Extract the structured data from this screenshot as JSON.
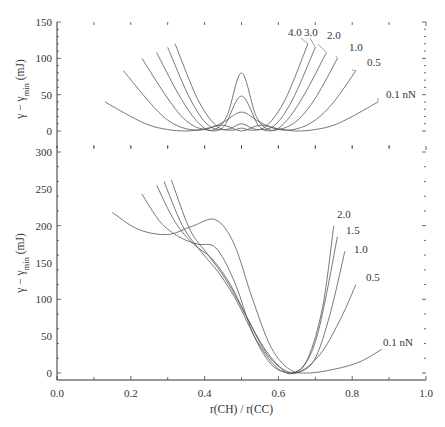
{
  "chart_data": [
    {
      "type": "line",
      "panel": "top",
      "title": "",
      "xlabel": "",
      "ylabel": "γ − γ_min (mJ)",
      "ylabel_parts": {
        "main": "γ − γ",
        "sub": "min",
        "unit": " (mJ)"
      },
      "xlim": [
        0.0,
        1.0
      ],
      "ylim": [
        -23,
        150
      ],
      "yticks": [
        0,
        50,
        100,
        150
      ],
      "ytick_labels": [
        "0",
        "50",
        "100",
        "150"
      ],
      "grid": false,
      "legend": "inline curve labels",
      "labels": [
        "4.0",
        "3.0",
        "2.0",
        "1.0",
        "0.5",
        "0.1 nN"
      ],
      "series": [
        {
          "name": "0.1 nN",
          "x": [
            0.13,
            0.2,
            0.25,
            0.3,
            0.35,
            0.4,
            0.45,
            0.5,
            0.55,
            0.6,
            0.65,
            0.7,
            0.75,
            0.8,
            0.87
          ],
          "values": [
            40,
            20,
            8,
            2,
            0,
            3,
            8,
            0,
            8,
            3,
            0,
            2,
            8,
            20,
            40
          ]
        },
        {
          "name": "0.5",
          "x": [
            0.18,
            0.25,
            0.3,
            0.35,
            0.4,
            0.45,
            0.5,
            0.55,
            0.6,
            0.65,
            0.7,
            0.75,
            0.81
          ],
          "values": [
            83,
            40,
            15,
            3,
            2,
            12,
            26,
            12,
            2,
            3,
            15,
            40,
            83
          ]
        },
        {
          "name": "1.0",
          "x": [
            0.23,
            0.3,
            0.35,
            0.4,
            0.45,
            0.5,
            0.55,
            0.6,
            0.65,
            0.7,
            0.76
          ],
          "values": [
            100,
            45,
            14,
            2,
            5,
            48,
            5,
            2,
            14,
            45,
            100
          ]
        },
        {
          "name": "2.0",
          "x": [
            0.27,
            0.33,
            0.38,
            0.42,
            0.46,
            0.5,
            0.54,
            0.58,
            0.62,
            0.67,
            0.73
          ],
          "values": [
            108,
            50,
            13,
            1,
            20,
            80,
            20,
            1,
            13,
            50,
            108
          ]
        },
        {
          "name": "3.0",
          "x": [
            0.3,
            0.36,
            0.41,
            0.46,
            0.5,
            0.54,
            0.59,
            0.64,
            0.7
          ],
          "values": [
            115,
            45,
            8,
            2,
            10,
            2,
            8,
            45,
            115
          ]
        },
        {
          "name": "4.0",
          "x": [
            0.32,
            0.38,
            0.43,
            0.47,
            0.5,
            0.53,
            0.57,
            0.62,
            0.68
          ],
          "values": [
            120,
            45,
            8,
            1,
            4,
            1,
            8,
            45,
            120
          ]
        }
      ]
    },
    {
      "type": "line",
      "panel": "bottom",
      "title": "",
      "xlabel": "r(CH) / r(CC)",
      "ylabel": "γ − γ_min (mJ)",
      "ylabel_parts": {
        "main": "γ − γ",
        "sub": "min",
        "unit": " (mJ)"
      },
      "xlim": [
        0.0,
        1.0
      ],
      "ylim": [
        -10,
        300
      ],
      "xticks": [
        0.0,
        0.2,
        0.4,
        0.6,
        0.8,
        1.0
      ],
      "xtick_labels": [
        "0.0",
        "0.2",
        "0.4",
        "0.6",
        "0.8",
        "1.0"
      ],
      "yticks": [
        0,
        50,
        100,
        150,
        200,
        250,
        300
      ],
      "ytick_labels": [
        "0",
        "50",
        "100",
        "150",
        "200",
        "250",
        "300"
      ],
      "grid": false,
      "legend": "inline curve labels",
      "labels": [
        "2.0",
        "1.5",
        "1.0",
        "0.5",
        "0.1 nN"
      ],
      "series": [
        {
          "name": "0.1 nN",
          "x": [
            0.15,
            0.22,
            0.3,
            0.37,
            0.43,
            0.48,
            0.53,
            0.58,
            0.63,
            0.68,
            0.75,
            0.82,
            0.88
          ],
          "values": [
            218,
            195,
            188,
            200,
            208,
            175,
            100,
            35,
            5,
            0,
            5,
            15,
            32
          ]
        },
        {
          "name": "0.5",
          "x": [
            0.23,
            0.28,
            0.33,
            0.38,
            0.43,
            0.48,
            0.53,
            0.58,
            0.63,
            0.67,
            0.72,
            0.77,
            0.81
          ],
          "values": [
            243,
            205,
            185,
            175,
            170,
            125,
            55,
            12,
            0,
            5,
            30,
            75,
            120
          ]
        },
        {
          "name": "1.0",
          "x": [
            0.27,
            0.32,
            0.37,
            0.42,
            0.47,
            0.52,
            0.57,
            0.62,
            0.66,
            0.7,
            0.74,
            0.78
          ],
          "values": [
            255,
            205,
            175,
            155,
            120,
            70,
            25,
            3,
            2,
            20,
            80,
            165
          ]
        },
        {
          "name": "1.5",
          "x": [
            0.29,
            0.34,
            0.39,
            0.44,
            0.49,
            0.54,
            0.59,
            0.63,
            0.67,
            0.71,
            0.76
          ],
          "values": [
            260,
            200,
            165,
            135,
            95,
            45,
            10,
            0,
            10,
            60,
            185
          ]
        },
        {
          "name": "2.0",
          "x": [
            0.31,
            0.36,
            0.41,
            0.46,
            0.51,
            0.56,
            0.61,
            0.64,
            0.68,
            0.72,
            0.75
          ],
          "values": [
            262,
            195,
            160,
            125,
            80,
            35,
            5,
            0,
            20,
            90,
            200
          ]
        }
      ]
    }
  ]
}
